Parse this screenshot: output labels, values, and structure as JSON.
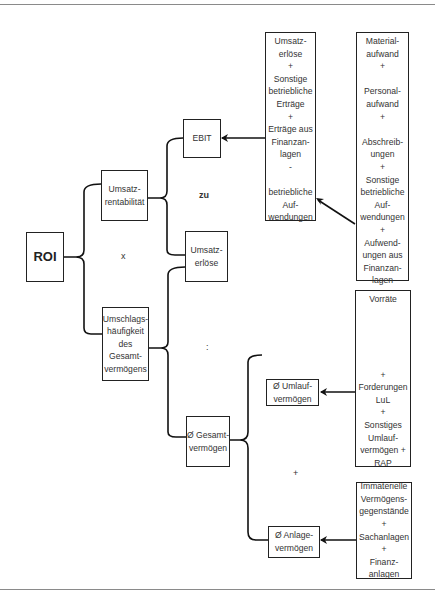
{
  "diagram": {
    "root": {
      "label": "ROI"
    },
    "level1": {
      "top": {
        "lines": [
          "Umsatz-",
          "rentabilität"
        ]
      },
      "operator": "x",
      "bottom": {
        "lines": [
          "Umschlags-",
          "häufigkeit",
          "des",
          "Gesamt-",
          "vermögens"
        ]
      }
    },
    "level2": {
      "ebit": {
        "lines": [
          "EBIT"
        ]
      },
      "operator_zu": "zu",
      "umsatzerloese": {
        "lines": [
          "Umsatz-",
          "erlöse"
        ]
      },
      "operator_div": ":",
      "gesamtvermoegen": {
        "lines": [
          "Ø Gesamt-",
          "vermögen"
        ]
      }
    },
    "level3": {
      "ebit_components": {
        "lines": [
          "Umsatz-",
          "erlöse",
          "+",
          "Sonstige",
          "betriebliche",
          "Erträge",
          "+",
          "Erträge aus",
          "Finanzan-",
          "lagen",
          "-",
          "",
          "betriebliche",
          "Auf-",
          "wendungen"
        ]
      },
      "umlaufvermoegen": {
        "lines": [
          "Ø Umlauf-",
          "vermögen"
        ]
      },
      "operator_plus": "+",
      "anlagevermoegen": {
        "lines": [
          "Ø Anlage-",
          "vermögen"
        ]
      }
    },
    "level4": {
      "aufwendungen": {
        "lines": [
          "Material-",
          "aufwand",
          "+",
          "",
          "Personal-",
          "aufwand",
          "+",
          "",
          "Abschreib-",
          "ungen",
          "+",
          "Sonstige",
          "betriebliche",
          "Auf-",
          "wendungen",
          "+",
          "Aufwend-",
          "ungen aus",
          "Finanzan-",
          "lagen"
        ]
      },
      "umlauf_components": {
        "lines": [
          "Vorräte",
          "",
          "",
          "",
          "",
          "",
          "+",
          "Forderungen",
          "LuL",
          "+",
          "Sonstiges",
          "Umlauf-",
          "vermögen +",
          "RAP"
        ]
      },
      "anlage_components": {
        "lines": [
          "Immaterielle",
          "Vermögens-",
          "gegenstände",
          "+",
          "Sachanlagen",
          "+",
          "Finanz-",
          "anlagen"
        ]
      }
    }
  }
}
